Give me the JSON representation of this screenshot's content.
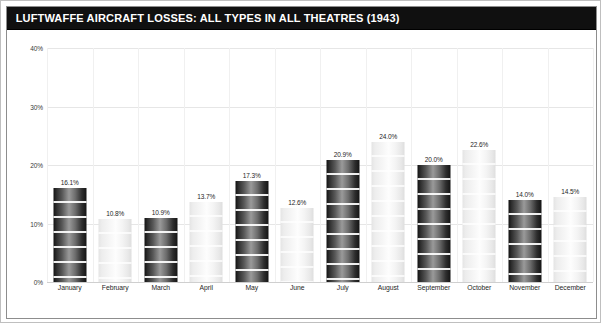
{
  "figure": {
    "title": "LUFTWAFFE AIRCRAFT LOSSES: ALL TYPES IN ALL THEATRES (1943)",
    "frame_color": "#8d8d8d",
    "title_bar_color": "#101010",
    "title_text_color": "#ffffff"
  },
  "chart_data": {
    "type": "bar",
    "title": "LUFTWAFFE AIRCRAFT LOSSES: ALL TYPES IN ALL THEATRES (1943)",
    "xlabel": "",
    "ylabel": "",
    "ylim": [
      0,
      40
    ],
    "yticks": [
      0,
      10,
      20,
      30,
      40
    ],
    "ytick_labels": [
      "0%",
      "10%",
      "20%",
      "30%",
      "40%"
    ],
    "grid": true,
    "legend": "none",
    "value_suffix": "%",
    "categories": [
      "January",
      "February",
      "March",
      "April",
      "May",
      "June",
      "July",
      "August",
      "September",
      "October",
      "November",
      "December"
    ],
    "values": [
      16.1,
      10.8,
      10.9,
      13.7,
      17.3,
      12.6,
      20.9,
      24.0,
      20.0,
      22.6,
      14.0,
      14.5
    ],
    "value_labels": [
      "16.1%",
      "10.8%",
      "10.9%",
      "13.7%",
      "17.3%",
      "12.6%",
      "20.9%",
      "24.0%",
      "20.0%",
      "22.6%",
      "14.0%",
      "14.5%"
    ],
    "bar_styles": [
      "dark",
      "light",
      "dark",
      "light",
      "dark",
      "light",
      "dark",
      "light",
      "dark",
      "light",
      "dark",
      "light"
    ],
    "colors": {
      "dark_bar": "#2e2e2e",
      "light_bar": "#f2f2f2",
      "gridline": "#e6e6e6",
      "text": "#262626"
    }
  }
}
